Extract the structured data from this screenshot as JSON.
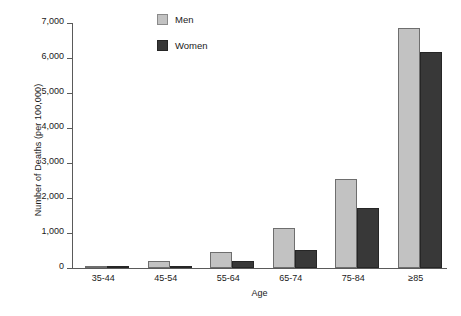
{
  "chart_data": {
    "type": "bar",
    "title": "",
    "xlabel": "Age",
    "ylabel": "Number of Deaths (per 100,000)",
    "categories": [
      "35-44",
      "45-54",
      "55-64",
      "65-74",
      "75-84",
      "≥85"
    ],
    "series": [
      {
        "name": "Men",
        "color": "#c2c2c2",
        "values": [
          50,
          200,
          470,
          1150,
          2530,
          6850
        ]
      },
      {
        "name": "Women",
        "color": "#383838",
        "values": [
          30,
          60,
          200,
          520,
          1720,
          6170
        ]
      }
    ],
    "ylim": [
      0,
      7000
    ],
    "ytick_labels": [
      "0",
      "1,000",
      "2,000",
      "3,000",
      "4,000",
      "5,000",
      "6,000",
      "7,000"
    ],
    "ytick_values": [
      0,
      1000,
      2000,
      3000,
      4000,
      5000,
      6000,
      7000
    ],
    "grid": false,
    "legend_position": "upper-center-left"
  },
  "legend": {
    "items": [
      {
        "label": "Men"
      },
      {
        "label": "Women"
      }
    ]
  }
}
